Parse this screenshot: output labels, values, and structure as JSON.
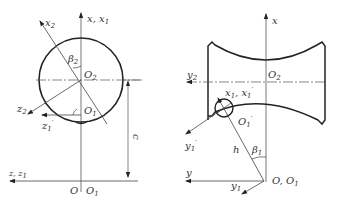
{
  "left_diagram": {
    "labels": {
      "x2": "x",
      "x2_sub": "2",
      "x_x1": "x, x",
      "x_x1_sub": "1",
      "beta2": "β",
      "beta2_sub": "2",
      "O2": "O",
      "O2_sub": "2",
      "z2": "z",
      "z2_sub": "2",
      "z1p": "z",
      "z1p_sub": "1",
      "z1p_prime": "′",
      "O1p": "O",
      "O1p_sub": "1",
      "c": "c",
      "z_z1": "z, z",
      "z_z1_sub": "1",
      "O": "O",
      "O1": "O",
      "O1_sub": "1"
    }
  },
  "right_diagram": {
    "labels": {
      "x": "x",
      "y2": "y",
      "y2_sub": "2",
      "O2": "O",
      "O2_sub": "2",
      "x1_x1p": "x",
      "x1_x1p_sub": "1",
      "x1_x1p_rest": ", x",
      "x1_x1p_sub2": "1",
      "x1_x1p_prime": "′",
      "O1p": "O",
      "O1p_sub": "1",
      "O1p_prime": "′",
      "y1p": "y",
      "y1p_sub": "1",
      "y1p_prime": "′",
      "h": "h",
      "beta1": "β",
      "beta1_sub": "1",
      "y": "y",
      "y1": "y",
      "y1_sub": "1",
      "O_O1": "O, O",
      "O_O1_sub": "1"
    }
  },
  "colors": {
    "stroke": "#222222",
    "thin": "#555555"
  }
}
